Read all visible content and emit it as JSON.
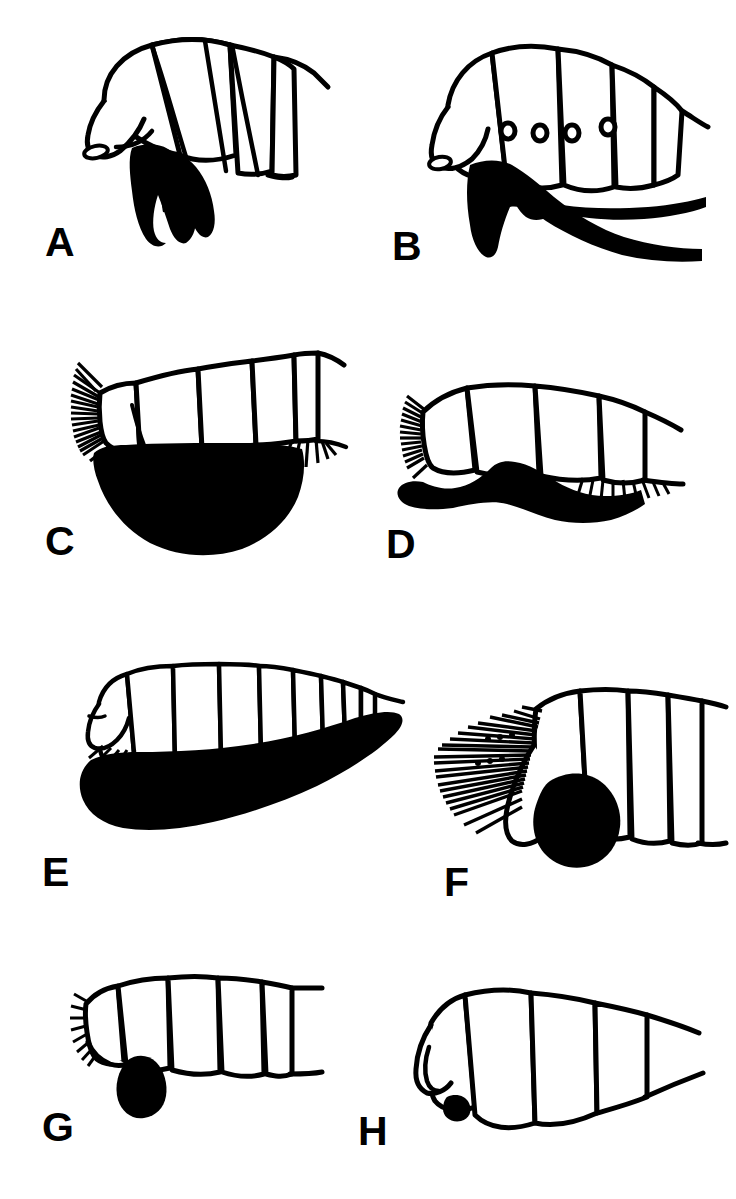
{
  "figure": {
    "running_header": "",
    "background_color": "#ffffff",
    "ink_color": "#000000",
    "width": 736,
    "height": 1199,
    "caption": "",
    "panel_count": 8
  },
  "panels": [
    {
      "label": "A",
      "label_x": 45,
      "label_y": 222,
      "name": "panel-a",
      "description": "Lateral view of insect abdomen, strongly arched, with four to five tergites and a short broad black terminalia projecting ventrally",
      "segment_count": 5,
      "spiracle_count": 0,
      "has_bristles": false,
      "black_structure": "short-broad-ventral-ovipositor"
    },
    {
      "label": "B",
      "label_x": 392,
      "label_y": 226,
      "name": "panel-b",
      "description": "Lateral view of insect abdomen with six tergites, four circular spiracles and a long slender black ovipositor extending posteriorly",
      "segment_count": 6,
      "spiracle_count": 4,
      "has_bristles": false,
      "black_structure": "long-slender-posterior-ovipositor"
    },
    {
      "label": "C",
      "label_x": 45,
      "label_y": 521,
      "name": "panel-c",
      "description": "Lateral view of insect abdomen with five tergites, dense comb of anterior bristles and a very large rounded black ventral terminalia",
      "segment_count": 5,
      "spiracle_count": 0,
      "has_bristles": true,
      "black_structure": "large-rounded-ventral-mass"
    },
    {
      "label": "D",
      "label_x": 386,
      "label_y": 524,
      "name": "panel-d",
      "description": "Lateral view of insect abdomen with four tergites, bristle fringes and an elongate black hook shaped ventral terminalia directed anteriorly",
      "segment_count": 4,
      "spiracle_count": 0,
      "has_bristles": true,
      "black_structure": "hook-shaped-anterior-process"
    },
    {
      "label": "E",
      "label_x": 42,
      "label_y": 852,
      "name": "panel-e",
      "description": "Lateral view of elongate insect abdomen with about ten narrow tergites and a massive black tapering ventral ovipositor sheath",
      "segment_count": 10,
      "spiracle_count": 0,
      "has_bristles": true,
      "black_structure": "large-tapering-ventral-sheath"
    },
    {
      "label": "F",
      "label_x": 444,
      "label_y": 862,
      "name": "panel-f",
      "description": "Lateral view of insect abdomen with four tergites, long radiating fan of bristles and a rounded black ventral terminalia",
      "segment_count": 4,
      "spiracle_count": 0,
      "has_bristles": true,
      "black_structure": "rounded-ventral-knob"
    },
    {
      "label": "G",
      "label_x": 42,
      "label_y": 1107,
      "name": "panel-g",
      "description": "Lateral view of insect abdomen with five tergites, short anterior bristle comb and a small teardrop shaped black ventral terminalia",
      "segment_count": 5,
      "spiracle_count": 0,
      "has_bristles": true,
      "black_structure": "small-teardrop-process"
    },
    {
      "label": "H",
      "label_x": 358,
      "label_y": 1111,
      "name": "panel-h",
      "description": "Lateral view of broad tapering insect abdomen with four tergites and a minute black ventral spot",
      "segment_count": 4,
      "spiracle_count": 0,
      "has_bristles": false,
      "black_structure": "minute-ventral-spot"
    }
  ]
}
